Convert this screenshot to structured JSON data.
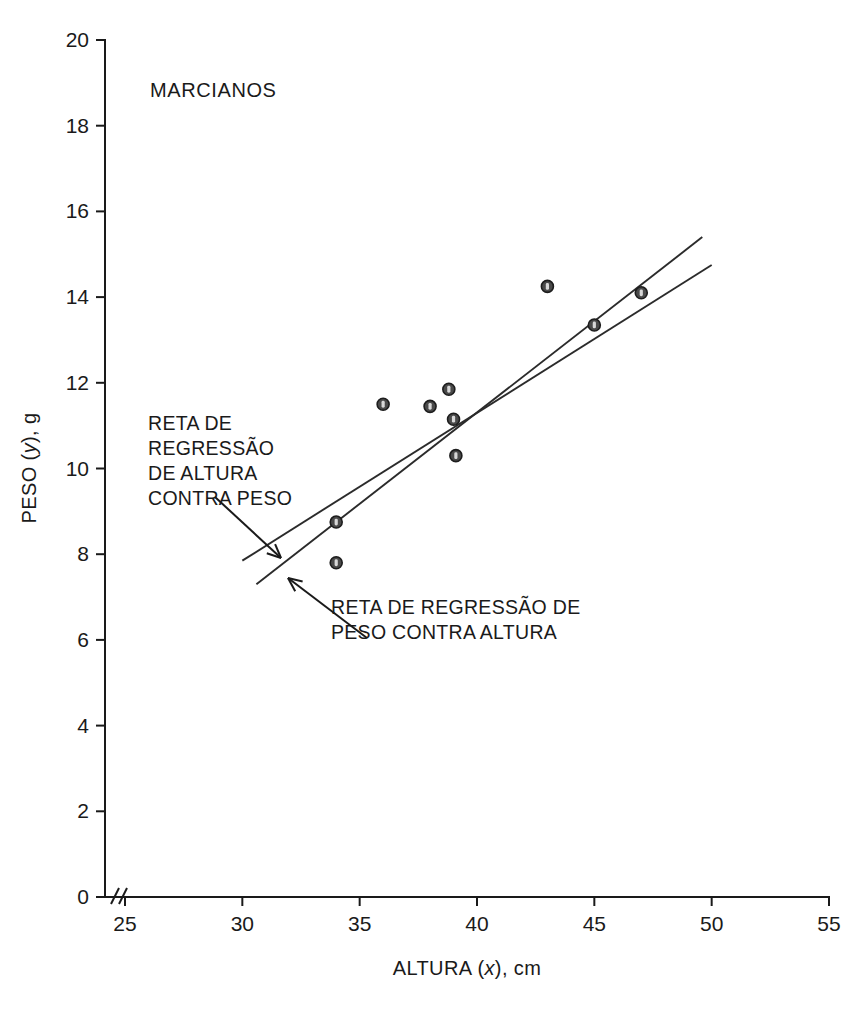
{
  "chart_data": {
    "type": "scatter",
    "title": "MARCIANOS",
    "xlabel_prefix": "ALTURA (",
    "xlabel_var": "x",
    "xlabel_suffix": "), cm",
    "ylabel_prefix": "PESO (",
    "ylabel_var": "y",
    "ylabel_suffix": "), g",
    "xlim": [
      25,
      55
    ],
    "ylim": [
      0,
      20
    ],
    "xticks": [
      25,
      30,
      35,
      40,
      45,
      50,
      55
    ],
    "yticks": [
      0,
      2,
      4,
      6,
      8,
      10,
      12,
      14,
      16,
      18,
      20
    ],
    "grid": false,
    "legend": "none",
    "axis_break": true,
    "axis_break_symbol": "//",
    "points": [
      {
        "x": 34.0,
        "y": 8.75
      },
      {
        "x": 34.0,
        "y": 7.8
      },
      {
        "x": 36.0,
        "y": 11.5
      },
      {
        "x": 38.0,
        "y": 11.45
      },
      {
        "x": 38.8,
        "y": 11.85
      },
      {
        "x": 39.0,
        "y": 11.15
      },
      {
        "x": 39.1,
        "y": 10.3
      },
      {
        "x": 43.0,
        "y": 14.25
      },
      {
        "x": 45.0,
        "y": 13.35
      },
      {
        "x": 47.0,
        "y": 14.1
      }
    ],
    "lines": [
      {
        "name": "reta-regressao-altura-contra-peso",
        "label": "RETA DE REGRESSÃO DE ALTURA CONTRA PESO",
        "x0": 30.6,
        "y0": 7.3,
        "x1": 49.6,
        "y1": 15.4
      },
      {
        "name": "reta-regressao-peso-contra-altura",
        "label": "RETA DE REGRESSÃO DE PESO CONTRA ALTURA",
        "x0": 30.0,
        "y0": 7.85,
        "x1": 50.0,
        "y1": 14.75
      }
    ],
    "annotations": [
      {
        "id": "annotation-altura-contra-peso",
        "lines": [
          "RETA DE",
          "REGRESSÃO",
          "DE ALTURA",
          "CONTRA PESO"
        ],
        "text_x": 148,
        "text_y": 430,
        "line_height": 25,
        "arrow_from_x": 215,
        "arrow_from_y": 497,
        "arrow_to_x": 281,
        "arrow_to_y": 558
      },
      {
        "id": "annotation-peso-contra-altura",
        "lines": [
          "RETA DE REGRESSÃO DE",
          "PESO CONTRA ALTURA"
        ],
        "text_x": 331,
        "text_y": 614,
        "line_height": 25,
        "arrow_from_x": 367,
        "arrow_from_y": 638,
        "arrow_to_x": 288,
        "arrow_to_y": 578
      }
    ]
  },
  "geometry": {
    "plot_left_px": 105,
    "plot_right_px": 829,
    "plot_top_px": 40,
    "plot_bottom_px": 897,
    "x_axis_start_px": 125,
    "tick_len": 9
  }
}
